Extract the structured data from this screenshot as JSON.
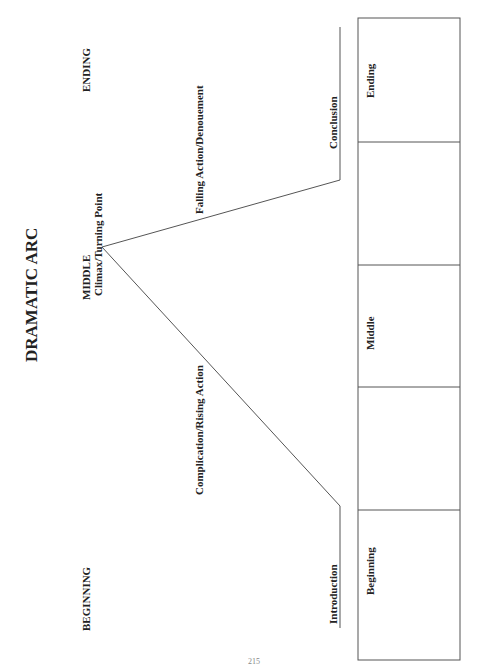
{
  "title": "DRAMATIC ARC",
  "sections": {
    "beginning": "BEGINNING",
    "middle": "MIDDLE",
    "ending": "ENDING"
  },
  "arc": {
    "introduction": "Introduction",
    "rising": "Complication/Rising Action",
    "climax": "Climax/Turning Point",
    "falling": "Falling Action/Denouement",
    "conclusion": "Conclusion"
  },
  "table": {
    "cells": [
      {
        "label": "Beginning"
      },
      {
        "label": ""
      },
      {
        "label": "Middle"
      },
      {
        "label": ""
      },
      {
        "label": "Ending"
      }
    ]
  },
  "page_number": "215"
}
